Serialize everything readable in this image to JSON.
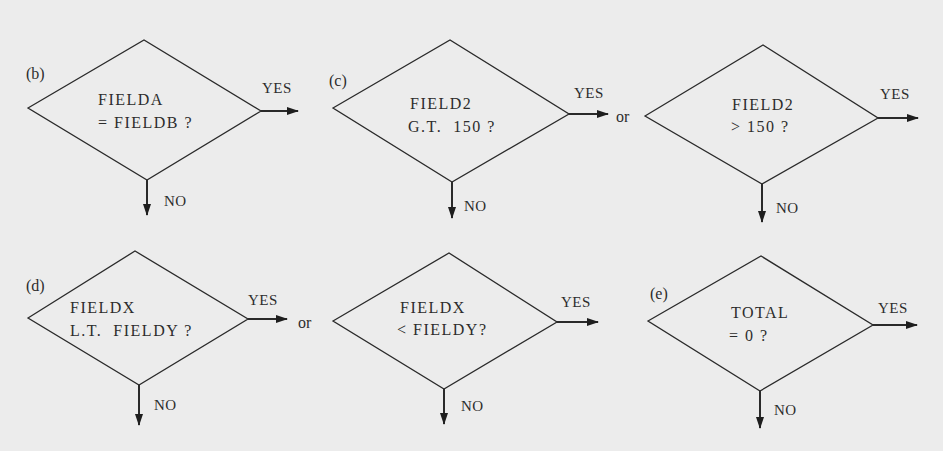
{
  "colors": {
    "background": "#ececec",
    "ink": "#2a2a2a"
  },
  "diagrams": [
    {
      "id": "b",
      "tag": "(b)",
      "lines": [
        "FIELDA",
        "= FIELDB ?"
      ],
      "yes": "YES",
      "no": "NO",
      "shape": {
        "left": [
          28,
          108
        ],
        "top": [
          144,
          40
        ],
        "right": [
          261,
          111
        ],
        "bottom": [
          147,
          180
        ]
      },
      "yes_arrow": [
        261,
        111,
        298
      ],
      "no_arrow": [
        147,
        180,
        215
      ]
    },
    {
      "id": "c1",
      "tag": "(c)",
      "lines": [
        "FIELD2",
        "G.T.  150 ?"
      ],
      "yes": "YES",
      "no": "NO",
      "shape": {
        "left": [
          333,
          108
        ],
        "top": [
          450,
          40
        ],
        "right": [
          569,
          114
        ],
        "bottom": [
          452,
          182
        ]
      },
      "yes_arrow": [
        569,
        114,
        608
      ],
      "no_arrow": [
        452,
        182,
        218
      ]
    },
    {
      "id": "c2",
      "tag": "",
      "lines": [
        "FIELD2",
        "> 150 ?"
      ],
      "yes": "YES",
      "no": "NO",
      "shape": {
        "left": [
          645,
          116
        ],
        "top": [
          763,
          45
        ],
        "right": [
          878,
          118
        ],
        "bottom": [
          762,
          184
        ]
      },
      "yes_arrow": [
        878,
        118,
        918
      ],
      "no_arrow": [
        762,
        184,
        222
      ]
    },
    {
      "id": "d1",
      "tag": "(d)",
      "lines": [
        "FIELDX",
        "L.T.  FIELDY ?"
      ],
      "yes": "YES",
      "no": "NO",
      "shape": {
        "left": [
          28,
          318
        ],
        "top": [
          135,
          251
        ],
        "right": [
          248,
          319
        ],
        "bottom": [
          139,
          385
        ]
      },
      "yes_arrow": [
        248,
        319,
        287
      ],
      "no_arrow": [
        139,
        385,
        425
      ]
    },
    {
      "id": "d2",
      "tag": "",
      "lines": [
        "FIELDX",
        "< FIELDY?"
      ],
      "yes": "YES",
      "no": "NO",
      "shape": {
        "left": [
          333,
          321
        ],
        "top": [
          449,
          253
        ],
        "right": [
          557,
          322
        ],
        "bottom": [
          444,
          389
        ]
      },
      "yes_arrow": [
        557,
        322,
        598
      ],
      "no_arrow": [
        444,
        389,
        424
      ]
    },
    {
      "id": "e",
      "tag": "(e)",
      "lines": [
        "TOTAL",
        "= 0 ?"
      ],
      "yes": "YES",
      "no": "NO",
      "shape": {
        "left": [
          648,
          321
        ],
        "top": [
          761,
          256
        ],
        "right": [
          873,
          325
        ],
        "bottom": [
          760,
          391
        ]
      },
      "yes_arrow": [
        873,
        325,
        917
      ],
      "no_arrow": [
        760,
        391,
        428
      ]
    }
  ],
  "connectors": [
    "or",
    "or"
  ]
}
